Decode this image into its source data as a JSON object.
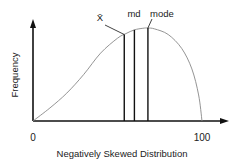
{
  "chart_data": {
    "type": "line",
    "title": "Negatively Skewed Distribution",
    "xlabel": "Negatively Skewed Distribution",
    "ylabel": "Frequency",
    "x_ticks": [
      "0",
      "100"
    ],
    "xlim": [
      0,
      100
    ],
    "curve": {
      "x": [
        0,
        10,
        20,
        30,
        40,
        50,
        55,
        60,
        65,
        68,
        72,
        80,
        88,
        94,
        98,
        100
      ],
      "y": [
        0,
        0.14,
        0.3,
        0.5,
        0.73,
        0.89,
        0.94,
        0.98,
        0.997,
        1.0,
        0.99,
        0.93,
        0.78,
        0.56,
        0.28,
        0
      ]
    },
    "markers": [
      {
        "name": "mean",
        "label": "X̄",
        "x": 54
      },
      {
        "name": "median",
        "label": "md",
        "x": 60
      },
      {
        "name": "mode",
        "label": "mode",
        "x": 68
      }
    ],
    "colors": {
      "axis": "#111111",
      "curve": "#888888",
      "marker": "#111111"
    }
  }
}
